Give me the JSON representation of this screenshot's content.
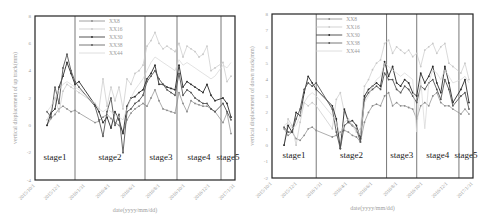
{
  "chart_data": [
    {
      "type": "line",
      "title": "",
      "xlabel": "date(yyyy/mm/dd)",
      "ylabel": "vertical displacement of up track(mm)",
      "ylim": [
        -4,
        8
      ],
      "yticks": [
        -4,
        -2,
        0,
        2,
        4,
        6,
        8
      ],
      "xticks": [
        "2015/10/1",
        "2015/12/1",
        "2016/1/31",
        "2016/4/1",
        "2016/6/1",
        "2016/8/1",
        "2016/10/1",
        "2016/12/1",
        "2017/1/31"
      ],
      "grid": false,
      "legend_position": "upper-center",
      "stages": [
        {
          "label": "stage1",
          "x_start": 0.0,
          "x_end": 0.2
        },
        {
          "label": "stage2",
          "x_start": 0.2,
          "x_end": 0.55
        },
        {
          "label": "stage3",
          "x_start": 0.55,
          "x_end": 0.71
        },
        {
          "label": "stage4",
          "x_start": 0.71,
          "x_end": 0.93
        },
        {
          "label": "stage5",
          "x_start": 0.93,
          "x_end": 1.0
        }
      ],
      "x": [
        0.06,
        0.08,
        0.1,
        0.12,
        0.14,
        0.16,
        0.18,
        0.2,
        0.22,
        0.3,
        0.32,
        0.34,
        0.36,
        0.38,
        0.4,
        0.42,
        0.44,
        0.46,
        0.48,
        0.5,
        0.52,
        0.54,
        0.56,
        0.58,
        0.6,
        0.62,
        0.64,
        0.66,
        0.68,
        0.7,
        0.72,
        0.74,
        0.76,
        0.78,
        0.8,
        0.82,
        0.84,
        0.86,
        0.88,
        0.9,
        0.94,
        0.96,
        0.98
      ],
      "series": [
        {
          "name": "XX8",
          "color": "#8a8a8a",
          "marker": "circle",
          "values": [
            0.0,
            0.5,
            0.8,
            1.2,
            1.4,
            1.2,
            1.0,
            1.1,
            0.9,
            0.2,
            0.3,
            0.6,
            0.8,
            0.5,
            0.2,
            0.0,
            -0.5,
            0.4,
            0.9,
            1.2,
            1.4,
            1.6,
            1.4,
            2.0,
            2.6,
            1.8,
            1.2,
            1.1,
            1.0,
            0.9,
            2.4,
            1.6,
            1.0,
            1.8,
            1.6,
            1.5,
            1.4,
            1.4,
            1.2,
            1.0,
            0.2,
            0.9,
            -0.6
          ]
        },
        {
          "name": "XX16",
          "color": "#c8c8c8",
          "marker": "triangle",
          "values": [
            0.4,
            1.0,
            2.0,
            1.0,
            2.5,
            3.0,
            2.8,
            2.6,
            2.4,
            1.6,
            1.2,
            3.4,
            1.4,
            2.8,
            1.8,
            2.8,
            1.2,
            3.4,
            3.0,
            3.8,
            4.0,
            4.4,
            5.8,
            6.2,
            6.8,
            6.0,
            5.6,
            5.8,
            5.6,
            5.4,
            6.0,
            5.0,
            5.8,
            5.6,
            5.4,
            5.0,
            5.2,
            5.8,
            4.0,
            4.2,
            4.6,
            3.2,
            3.6
          ]
        },
        {
          "name": "XX30",
          "color": "#2a2a2a",
          "marker": "plus",
          "values": [
            0.0,
            0.9,
            1.2,
            2.8,
            3.6,
            4.6,
            3.8,
            3.0,
            3.2,
            1.5,
            1.0,
            0.2,
            0.6,
            -0.2,
            1.0,
            0.4,
            -0.6,
            1.4,
            2.0,
            2.1,
            2.4,
            2.6,
            3.4,
            3.8,
            4.4,
            3.0,
            3.0,
            2.8,
            2.7,
            2.6,
            4.4,
            2.8,
            3.2,
            3.0,
            2.8,
            2.6,
            2.4,
            3.0,
            2.2,
            1.8,
            2.0,
            1.6,
            0.6
          ]
        },
        {
          "name": "XX38",
          "color": "#555555",
          "marker": "square",
          "values": [
            1.0,
            0.6,
            2.8,
            1.6,
            4.2,
            5.2,
            4.0,
            3.2,
            2.8,
            1.4,
            0.4,
            -0.8,
            1.0,
            2.0,
            0.0,
            0.8,
            -2.0,
            1.0,
            1.2,
            1.6,
            1.8,
            2.2,
            3.2,
            3.6,
            4.0,
            3.4,
            3.0,
            2.6,
            2.4,
            2.2,
            3.8,
            2.2,
            2.6,
            2.4,
            2.0,
            1.8,
            1.6,
            1.6,
            1.2,
            1.0,
            1.6,
            1.0,
            0.4
          ]
        },
        {
          "name": "XX44",
          "color": "#d6d6d6",
          "marker": "none",
          "values": [
            1.0,
            1.4,
            2.0,
            2.6,
            3.0,
            3.2,
            3.0,
            2.8,
            2.6,
            1.6,
            1.2,
            1.0,
            1.2,
            1.0,
            0.8,
            0.6,
            0.4,
            1.2,
            2.0,
            2.6,
            3.0,
            3.4,
            4.0,
            4.6,
            5.0,
            4.8,
            4.6,
            4.4,
            4.2,
            4.0,
            4.8,
            4.4,
            4.6,
            4.4,
            4.2,
            4.0,
            3.8,
            3.6,
            3.4,
            3.6,
            4.4,
            4.2,
            4.6
          ]
        }
      ]
    },
    {
      "type": "line",
      "title": "",
      "xlabel": "date(yyyy/mm/dd)",
      "ylabel": "vertical displacement of down track(mm)",
      "ylim": [
        -2,
        8
      ],
      "yticks": [
        -2,
        -1,
        0,
        1,
        2,
        3,
        4,
        5,
        6,
        7,
        8
      ],
      "xticks": [
        "2015/10/1",
        "2015/12/1",
        "2016/1/31",
        "2016/4/1",
        "2016/6/1",
        "2016/8/1",
        "2016/10/1",
        "2016/12/1",
        "2017/1/31"
      ],
      "grid": false,
      "legend_position": "upper-center",
      "stages": [
        {
          "label": "stage1",
          "x_start": 0.0,
          "x_end": 0.22
        },
        {
          "label": "stage2",
          "x_start": 0.22,
          "x_end": 0.57
        },
        {
          "label": "stage3",
          "x_start": 0.57,
          "x_end": 0.72
        },
        {
          "label": "stage4",
          "x_start": 0.72,
          "x_end": 0.93
        },
        {
          "label": "stage5",
          "x_start": 0.93,
          "x_end": 1.0
        }
      ],
      "x": [
        0.06,
        0.08,
        0.1,
        0.12,
        0.14,
        0.16,
        0.18,
        0.2,
        0.22,
        0.3,
        0.32,
        0.34,
        0.36,
        0.38,
        0.4,
        0.42,
        0.44,
        0.46,
        0.48,
        0.5,
        0.52,
        0.54,
        0.56,
        0.58,
        0.6,
        0.62,
        0.64,
        0.66,
        0.68,
        0.7,
        0.72,
        0.74,
        0.76,
        0.78,
        0.8,
        0.82,
        0.84,
        0.86,
        0.88,
        0.9,
        0.94,
        0.96,
        0.98
      ],
      "series": [
        {
          "name": "XX8",
          "color": "#8a8a8a",
          "marker": "circle",
          "values": [
            1.0,
            0.6,
            0.8,
            0.4,
            0.3,
            0.6,
            1.0,
            1.1,
            0.9,
            0.5,
            0.6,
            0.8,
            0.9,
            0.8,
            0.6,
            0.5,
            0.2,
            1.4,
            2.0,
            2.4,
            2.5,
            2.4,
            3.0,
            3.2,
            2.4,
            2.6,
            2.4,
            2.4,
            2.3,
            2.2,
            1.6,
            2.4,
            2.6,
            2.4,
            3.0,
            3.2,
            2.6,
            2.4,
            2.4,
            2.2,
            1.9,
            2.2,
            1.9
          ]
        },
        {
          "name": "XX16",
          "color": "#c8c8c8",
          "marker": "triangle",
          "values": [
            0.0,
            1.6,
            1.2,
            0.0,
            1.4,
            2.6,
            2.4,
            2.6,
            2.4,
            1.0,
            2.8,
            3.2,
            2.0,
            1.6,
            1.2,
            0.8,
            1.0,
            3.6,
            4.0,
            4.6,
            5.0,
            5.2,
            6.2,
            6.4,
            5.6,
            6.0,
            5.8,
            5.6,
            5.8,
            5.4,
            5.6,
            4.8,
            5.8,
            6.0,
            6.2,
            5.6,
            6.0,
            6.2,
            5.0,
            4.8,
            4.4,
            5.0,
            4.0
          ]
        },
        {
          "name": "XX30",
          "color": "#2a2a2a",
          "marker": "plus",
          "values": [
            0.0,
            1.2,
            0.8,
            2.0,
            1.8,
            3.2,
            4.2,
            3.8,
            3.4,
            2.4,
            1.6,
            -0.2,
            2.2,
            1.4,
            1.5,
            1.2,
            0.4,
            3.0,
            3.4,
            3.6,
            3.8,
            3.6,
            5.1,
            4.2,
            4.8,
            3.8,
            3.6,
            4.0,
            3.8,
            3.2,
            3.0,
            4.4,
            3.8,
            4.2,
            4.8,
            3.8,
            3.2,
            4.8,
            3.8,
            2.6,
            3.4,
            4.0,
            2.6
          ]
        },
        {
          "name": "XX38",
          "color": "#555555",
          "marker": "square",
          "values": [
            1.1,
            0.8,
            0.8,
            1.6,
            2.2,
            3.4,
            3.8,
            3.6,
            3.8,
            2.2,
            0.8,
            -0.2,
            1.2,
            1.4,
            1.2,
            1.0,
            0.2,
            2.8,
            3.2,
            3.4,
            3.6,
            3.4,
            4.4,
            4.0,
            4.0,
            3.4,
            3.2,
            3.6,
            3.4,
            3.0,
            2.6,
            3.6,
            3.4,
            3.8,
            4.0,
            3.4,
            2.8,
            4.0,
            3.4,
            2.4,
            3.0,
            3.2,
            2.2
          ]
        },
        {
          "name": "XX44",
          "color": "#d6d6d6",
          "marker": "none",
          "values": [
            1.2,
            1.4,
            1.0,
            1.2,
            1.8,
            2.6,
            3.0,
            3.2,
            3.0,
            1.8,
            1.4,
            0.6,
            1.4,
            1.6,
            1.2,
            1.0,
            0.6,
            2.6,
            3.0,
            3.6,
            4.0,
            4.2,
            5.0,
            4.8,
            4.6,
            4.4,
            4.2,
            4.4,
            4.2,
            4.0,
            0.8,
            4.0,
            1.0,
            3.8,
            4.6,
            4.4,
            4.0,
            4.6,
            4.2,
            3.8,
            4.0,
            4.2,
            3.8
          ]
        }
      ]
    }
  ],
  "left_chart": {
    "ylabel": "vertical displacement of up track(mm)",
    "xlabel": "date(yyyy/mm/dd)",
    "yticks": [
      "8",
      "6",
      "4",
      "2",
      "0",
      "-2",
      "-4"
    ],
    "xticks": [
      "2015/10/1",
      "2015/12/1",
      "2016/1/31",
      "2016/4/1",
      "2016/6/1",
      "2016/8/1",
      "2016/10/1",
      "2016/12/1",
      "2017/1/31"
    ],
    "legend": [
      "XX8",
      "XX16",
      "XX30",
      "XX38",
      "XX44"
    ],
    "stages": [
      "stage1",
      "stage2",
      "stage3",
      "stage4",
      "stage5"
    ]
  },
  "right_chart": {
    "ylabel": "vertical displacement of down track(mm)",
    "xlabel": "date(yyyy/mm/dd)",
    "yticks": [
      "8",
      "7",
      "6",
      "5",
      "4",
      "3",
      "2",
      "1",
      "0",
      "-1",
      "-2"
    ],
    "xticks": [
      "2015/10/1",
      "2015/12/1",
      "2016/1/31",
      "2016/4/1",
      "2016/6/1",
      "2016/8/1",
      "2016/10/1",
      "2016/12/1",
      "2017/1/31"
    ],
    "legend": [
      "XX8",
      "XX16",
      "XX30",
      "XX38",
      "XX44"
    ],
    "stages": [
      "stage1",
      "stage2",
      "stage3",
      "stage4",
      "stage5"
    ]
  }
}
